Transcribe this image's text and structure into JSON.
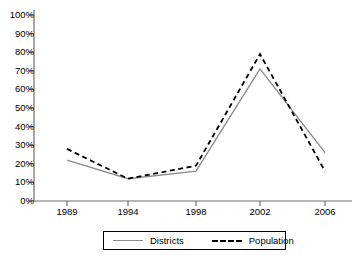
{
  "chart_data": {
    "type": "line",
    "title": "",
    "xlabel": "",
    "ylabel": "",
    "categories": [
      "1989",
      "1994",
      "1998",
      "2002",
      "2006"
    ],
    "x": [
      1989,
      1994,
      1998,
      2002,
      2006
    ],
    "series": [
      {
        "name": "Districts",
        "style": "solid",
        "color": "#8c8c8c",
        "values": [
          22,
          12,
          16,
          71,
          26
        ]
      },
      {
        "name": "Population",
        "style": "dashed",
        "color": "#000000",
        "values": [
          28,
          12,
          19,
          79,
          16
        ]
      }
    ],
    "ylim": [
      0,
      100
    ],
    "ytick_values": [
      0,
      10,
      20,
      30,
      40,
      50,
      60,
      70,
      80,
      90,
      100
    ],
    "ytick_labels": [
      "0%",
      "10%",
      "20%",
      "30%",
      "40%",
      "50%",
      "60%",
      "70%",
      "80%",
      "90%",
      "100%"
    ],
    "xtick_labels": [
      "1989",
      "1994",
      "1998",
      "2002",
      "2006"
    ],
    "grid": false,
    "legend_position": "bottom",
    "legend_entries": [
      {
        "label": "Districts",
        "style": "solid",
        "color": "#8c8c8c"
      },
      {
        "label": "Population",
        "style": "dashed",
        "color": "#000000"
      }
    ],
    "axis_color": "#6e6e6e"
  },
  "legend": {
    "districts_label": "Districts",
    "population_label": "Population"
  }
}
